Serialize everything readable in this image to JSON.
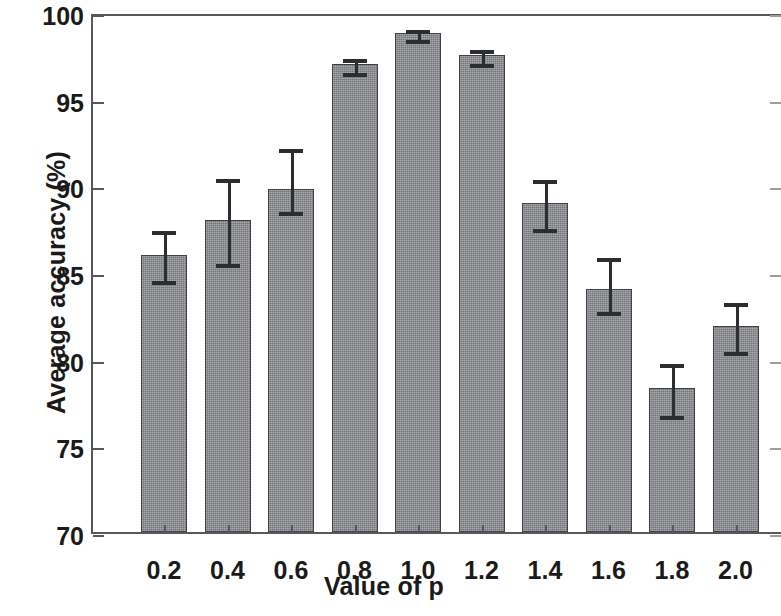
{
  "chart_data": {
    "type": "bar",
    "title": "",
    "xlabel": "Value of p",
    "ylabel": "Average accuracy (%)",
    "categories": [
      "0.2",
      "0.4",
      "0.6",
      "0.8",
      "1.0",
      "1.2",
      "1.4",
      "1.6",
      "1.8",
      "2.0"
    ],
    "values": [
      86.0,
      88.0,
      89.8,
      97.0,
      98.8,
      97.5,
      89.0,
      84.0,
      78.3,
      81.9
    ],
    "errors_upper": [
      1.5,
      2.5,
      2.4,
      0.4,
      0.3,
      0.4,
      1.4,
      1.9,
      1.5,
      1.4
    ],
    "errors_lower": [
      1.4,
      2.4,
      1.2,
      0.4,
      0.3,
      0.4,
      1.4,
      1.2,
      1.5,
      1.4
    ],
    "ylim": [
      70,
      100
    ],
    "ytick_labels": [
      "70",
      "75",
      "80",
      "85",
      "90",
      "95",
      "100"
    ],
    "ytick_values": [
      70,
      75,
      80,
      85,
      90,
      95,
      100
    ],
    "grid": false,
    "legend": "none",
    "bar_color": "#8e9094",
    "bar_edge_color": "#3f4246",
    "error_color": "#2b2d30",
    "axis_color": "#55585c"
  }
}
